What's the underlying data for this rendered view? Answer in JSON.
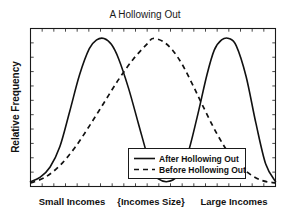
{
  "chart_data": {
    "type": "line",
    "title": "A Hollowing Out",
    "xlabel": "",
    "ylabel": "Relative Frequency",
    "grid": false,
    "legend_position": "center-right-inside",
    "xtick_labels": [
      "Small Incomes",
      "{Incomes Size}",
      "Large Incomes"
    ],
    "ytick_labels": [],
    "xlim": [
      0,
      100
    ],
    "ylim": [
      0,
      1
    ],
    "axis_ticks": {
      "x_count": 21,
      "y_count": 11,
      "direction": "inward"
    },
    "series": [
      {
        "name": "After Hollowing Out",
        "style": "solid",
        "color": "#111111",
        "description": "Bimodal distribution with peaks at small and large incomes and a hollow middle",
        "x": [
          0,
          4,
          8,
          12,
          16,
          20,
          24,
          27,
          30,
          33,
          36,
          40,
          44,
          48,
          50,
          52,
          56,
          60,
          64,
          68,
          72,
          75,
          78,
          81,
          84,
          88,
          92,
          96,
          100
        ],
        "y": [
          0.02,
          0.05,
          0.12,
          0.26,
          0.5,
          0.75,
          0.93,
          0.99,
          1.0,
          0.96,
          0.86,
          0.66,
          0.42,
          0.18,
          0.09,
          0.04,
          0.02,
          0.06,
          0.2,
          0.46,
          0.75,
          0.92,
          0.99,
          1.0,
          0.95,
          0.74,
          0.42,
          0.14,
          0.02
        ]
      },
      {
        "name": "Before Hollowing Out",
        "style": "dashed",
        "color": "#111111",
        "description": "Unimodal distribution centered on middle incomes",
        "x": [
          0,
          6,
          12,
          18,
          24,
          30,
          36,
          42,
          48,
          50,
          54,
          58,
          62,
          66,
          70,
          76,
          82,
          88,
          94,
          100
        ],
        "y": [
          0.01,
          0.05,
          0.13,
          0.25,
          0.4,
          0.56,
          0.72,
          0.86,
          0.97,
          1.0,
          0.98,
          0.92,
          0.82,
          0.69,
          0.55,
          0.35,
          0.19,
          0.09,
          0.03,
          0.01
        ]
      }
    ]
  },
  "legend": {
    "entries": [
      {
        "label": "After Hollowing Out",
        "style": "solid"
      },
      {
        "label": "Before Hollowing Out",
        "style": "dashed"
      }
    ]
  },
  "colors": {
    "ink": "#111111",
    "frame": "#1a1a1a",
    "background": "#ffffff"
  }
}
